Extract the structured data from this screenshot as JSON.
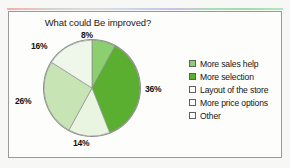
{
  "frame": {
    "background_color": "#fdfdfc",
    "border_color": "#9a9a9a"
  },
  "chart_data": {
    "type": "pie",
    "title": "What could Be improved?",
    "xlabel": "",
    "ylabel": "",
    "legend_position": "right",
    "grid": false,
    "start_angle_deg": 0,
    "direction": "clockwise",
    "categories": [
      "More sales help",
      "More selection",
      "Layout of the store",
      "More price options",
      "Other"
    ],
    "values": [
      8,
      36,
      14,
      26,
      16
    ],
    "value_labels": [
      "8%",
      "36%",
      "14%",
      "26%",
      "16%"
    ],
    "colors": [
      "#8ccf6e",
      "#5aaf30",
      "#e9f4e1",
      "#c6e4b4",
      "#eef7ea"
    ],
    "slices": [
      {
        "label": "More sales help",
        "value": 8,
        "display": "8%",
        "color": "#8ccf6e"
      },
      {
        "label": "More selection",
        "value": 36,
        "display": "36%",
        "color": "#5aaf30"
      },
      {
        "label": "Layout of the store",
        "value": 14,
        "display": "14%",
        "color": "#e9f4e1"
      },
      {
        "label": "More price options",
        "value": 26,
        "display": "26%",
        "color": "#c6e4b4"
      },
      {
        "label": "Other",
        "value": 16,
        "display": "16%",
        "color": "#eef7ea"
      }
    ]
  },
  "legend": {
    "items": [
      {
        "label": "More sales help",
        "color": "#8ccf6e"
      },
      {
        "label": "More selection",
        "color": "#5aaf30"
      },
      {
        "label": "Layout of the store",
        "color": "#fbfdfa"
      },
      {
        "label": "More price options",
        "color": "#fbfdfa"
      },
      {
        "label": "Other",
        "color": "#fbfdfa"
      }
    ]
  }
}
